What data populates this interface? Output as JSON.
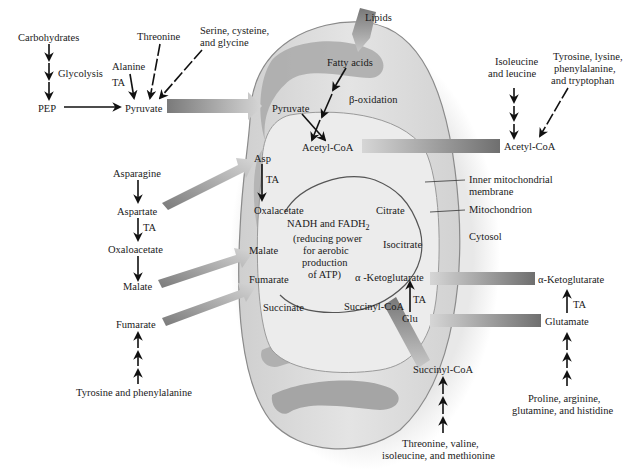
{
  "diagram": {
    "colors": {
      "mito_outer": "#d9d9d9",
      "mito_inner": "#e6e6e6",
      "cristae": "#a9a9a9",
      "arrow_dark": "#7a7a7a",
      "arrow_light": "#d4d4d4",
      "text": "#1a1a1a",
      "background": "#ffffff"
    },
    "cytosol": {
      "carbohydrates": "Carbohydrates",
      "glycolysis": "Glycolysis",
      "pep": "PEP",
      "alanine": "Alanine",
      "ta_alanine": "TA",
      "threonine": "Threonine",
      "serine_line1": "Serine, cysteine,",
      "serine_line2": "and glycine",
      "pyruvate": "Pyruvate",
      "lipids": "Lipids",
      "isoleucine_line1": "Isoleucine",
      "isoleucine_line2": "and leucine",
      "tyrosine_line1": "Tyrosine, lysine,",
      "tyrosine_line2": "phenylalanine,",
      "tyrosine_line3": "and tryptophan",
      "acetyl_coa": "Acetyl-CoA",
      "asparagine": "Asparagine",
      "aspartate": "Aspartate",
      "ta_aspartate": "TA",
      "oxaloacetate": "Oxaloacetate",
      "malate": "Malate",
      "fumarate": "Fumarate",
      "tyr_phe": "Tyrosine and phenylalanine",
      "alpha_kg": "α-Ketoglutarate",
      "ta_glutamate": "TA",
      "glutamate": "Glutamate",
      "proline_line1": "Proline, arginine,",
      "proline_line2": "glutamine, and histidine",
      "succinyl_coa": "Succinyl-CoA",
      "threonine2_line1": "Threonine, valine,",
      "threonine2_line2": "isoleucine, and methionine",
      "inner_membrane_line1": "Inner mitochondrial",
      "inner_membrane_line2": "membrane",
      "mitochondrion": "Mitochondrion",
      "cytosol": "Cytosol"
    },
    "matrix": {
      "pyruvate": "Pyruvate",
      "fatty_acids": "Fatty acids",
      "beta_oxidation": "β-oxidation",
      "acetyl_coa": "Acetyl-CoA",
      "asp": "Asp",
      "ta_asp": "TA",
      "oxalacetate": "Oxalacetate",
      "citrate": "Citrate",
      "isocitrate": "Isocitrate",
      "alpha_kg": "α -Ketoglutarate",
      "succinyl_coa": "Succinyl-CoA",
      "ta_glu": "TA",
      "glu": "Glu",
      "succinate": "Succinate",
      "fumarate": "Fumarate",
      "malate": "Malate",
      "center_line1": "NADH and FADH",
      "center_sub": "2",
      "center_line2": "(reducing power",
      "center_line3": "for aerobic",
      "center_line4": "production",
      "center_line5": "of ATP)"
    }
  }
}
